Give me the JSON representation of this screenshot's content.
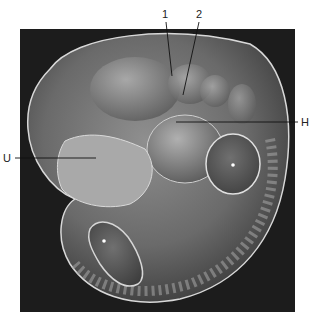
{
  "figure": {
    "type": "scanning electron micrograph",
    "labels": [
      {
        "id": "1",
        "text": "1"
      },
      {
        "id": "2",
        "text": "2"
      },
      {
        "id": "H",
        "text": "H"
      },
      {
        "id": "U",
        "text": "U"
      }
    ],
    "markers": [
      {
        "symbol": "*"
      },
      {
        "symbol": "*"
      }
    ],
    "colors": {
      "background": "#1c1c1c",
      "tissue_light": "#c8c8c8",
      "tissue_mid": "#8a8a8a",
      "tissue_dark": "#4a4a4a",
      "label_line": "#111111"
    }
  }
}
